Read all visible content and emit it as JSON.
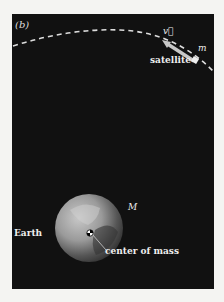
{
  "figure": {
    "panel_label": "(b)",
    "labels": {
      "velocity": "v⃗",
      "satellite": "satellite",
      "satellite_mass": "m",
      "earth": "Earth",
      "earth_mass": "M",
      "center_of_mass": "center of mass"
    },
    "colors": {
      "background": "#111111",
      "page": "#f4f4f2",
      "orbit": "#dddddd",
      "arrow": "#c8c8c8",
      "earth_light": "#b5b5b5",
      "earth_dark": "#3a3a3a"
    }
  }
}
